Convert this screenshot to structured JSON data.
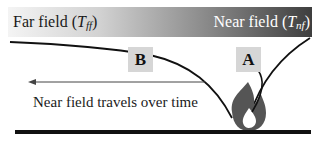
{
  "header_band": {
    "far_field_label": "Far field (",
    "far_field_symbol": "T",
    "far_field_subscript": "ff",
    "near_field_label": "Near field (",
    "near_field_symbol": "T",
    "near_field_subscript": "nf",
    "close_paren": ")",
    "gradient_colors": [
      "#f4f4f4",
      "#3e3e3e"
    ]
  },
  "markers": {
    "b_label": "B",
    "a_label": "A",
    "box_color": "#d6d6d6"
  },
  "arrow": {
    "direction": "left"
  },
  "caption": "Near field travels over time",
  "icons": {
    "fire": "fire-icon",
    "fire_color": "#555555"
  },
  "ground": {
    "color": "#111111"
  }
}
